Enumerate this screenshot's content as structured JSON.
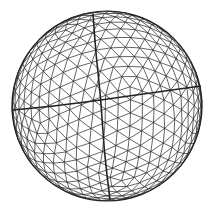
{
  "figure": {
    "background": "#ffffff",
    "stroke_color": "#222222",
    "center": [
      107,
      106
    ],
    "radius": 95,
    "meridian_divisions": 14,
    "parallel_divisions": 12,
    "great_circles": [
      {
        "name": "equator",
        "points": [
          [
            13,
            110
          ],
          [
            55,
            106
          ],
          [
            101,
            100
          ],
          [
            150,
            93
          ],
          [
            201,
            86
          ]
        ]
      },
      {
        "name": "meridian",
        "points": [
          [
            93,
            14
          ],
          [
            96,
            55
          ],
          [
            101,
            100
          ],
          [
            104,
            150
          ],
          [
            110,
            200
          ]
        ]
      }
    ]
  }
}
